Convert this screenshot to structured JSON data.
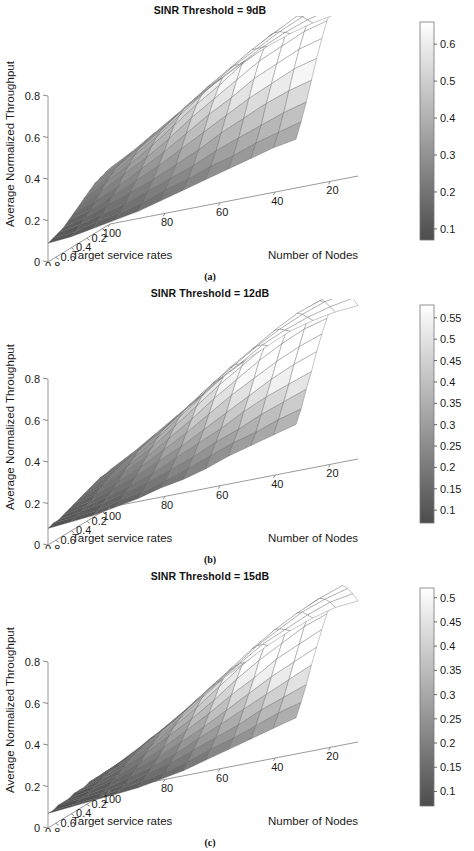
{
  "figure": {
    "panels": [
      {
        "id": "panel-a",
        "title": "SINR Threshold = 9dB",
        "caption": "(a)",
        "zlabel": "Average Normalized Throughput",
        "xlabel": "Target service rates",
        "ylabel": "Number of Nodes",
        "colorbar_ticks": [
          "0.6",
          "0.5",
          "0.4",
          "0.3",
          "0.2",
          "0.1"
        ]
      },
      {
        "id": "panel-b",
        "title": "SINR Threshold = 12dB",
        "caption": "(b)",
        "zlabel": "Average Normalized Throughput",
        "xlabel": "Target service rates",
        "ylabel": "Number of Nodes",
        "colorbar_ticks": [
          "0.55",
          "0.5",
          "0.45",
          "0.4",
          "0.35",
          "0.3",
          "0.25",
          "0.2",
          "0.15",
          "0.1"
        ]
      },
      {
        "id": "panel-c",
        "title": "SINR Threshold = 15dB",
        "caption": "(c)",
        "zlabel": "Average Normalized Throughput",
        "xlabel": "Target service rates",
        "ylabel": "Number of Nodes",
        "colorbar_ticks": [
          "0.5",
          "0.45",
          "0.4",
          "0.35",
          "0.3",
          "0.25",
          "0.2",
          "0.15",
          "0.1"
        ]
      }
    ]
  },
  "chart_data": [
    {
      "type": "surface",
      "panel": "(a)",
      "title": "SINR Threshold = 9dB",
      "xlabel": "Target service rates",
      "ylabel": "Number of Nodes",
      "zlabel": "Average Normalized Throughput",
      "x_ticks": [
        0.8,
        0.6,
        0.4,
        0.2
      ],
      "y_ticks": [
        100,
        80,
        60,
        40,
        20
      ],
      "z_ticks": [
        0,
        0.2,
        0.4,
        0.6,
        0.8
      ],
      "zlim": [
        0,
        0.8
      ],
      "xlim": [
        0.1,
        0.9
      ],
      "ylim": [
        10,
        100
      ],
      "colormap": "gray",
      "clim": [
        0.07,
        0.66
      ],
      "colorbar_ticks": [
        0.1,
        0.2,
        0.3,
        0.4,
        0.5,
        0.6
      ],
      "peak_value": 0.93,
      "left_edge_value": 0.27,
      "front_right_value": 0.13,
      "grid": true,
      "surface_z": [
        [
          0.27,
          0.33,
          0.4,
          0.47,
          0.54,
          0.6,
          0.66,
          0.71,
          0.75,
          0.78,
          0.8,
          0.81
        ],
        [
          0.26,
          0.32,
          0.39,
          0.46,
          0.53,
          0.6,
          0.66,
          0.72,
          0.77,
          0.81,
          0.84,
          0.86
        ],
        [
          0.25,
          0.31,
          0.38,
          0.45,
          0.53,
          0.6,
          0.67,
          0.73,
          0.79,
          0.84,
          0.88,
          0.9
        ],
        [
          0.24,
          0.3,
          0.37,
          0.44,
          0.52,
          0.6,
          0.67,
          0.74,
          0.8,
          0.86,
          0.9,
          0.93
        ],
        [
          0.22,
          0.28,
          0.35,
          0.42,
          0.5,
          0.58,
          0.66,
          0.73,
          0.8,
          0.85,
          0.9,
          0.92
        ],
        [
          0.2,
          0.26,
          0.32,
          0.39,
          0.47,
          0.55,
          0.62,
          0.7,
          0.76,
          0.82,
          0.86,
          0.89
        ],
        [
          0.18,
          0.23,
          0.29,
          0.35,
          0.42,
          0.5,
          0.57,
          0.64,
          0.71,
          0.76,
          0.81,
          0.84
        ],
        [
          0.16,
          0.2,
          0.25,
          0.31,
          0.37,
          0.44,
          0.51,
          0.57,
          0.64,
          0.69,
          0.74,
          0.77
        ],
        [
          0.14,
          0.17,
          0.22,
          0.27,
          0.32,
          0.38,
          0.44,
          0.5,
          0.56,
          0.61,
          0.66,
          0.69
        ],
        [
          0.12,
          0.15,
          0.19,
          0.23,
          0.27,
          0.32,
          0.37,
          0.43,
          0.48,
          0.53,
          0.57,
          0.6
        ],
        [
          0.11,
          0.13,
          0.16,
          0.19,
          0.23,
          0.27,
          0.31,
          0.36,
          0.4,
          0.44,
          0.48,
          0.51
        ],
        [
          0.1,
          0.11,
          0.14,
          0.16,
          0.19,
          0.23,
          0.26,
          0.3,
          0.33,
          0.37,
          0.4,
          0.43
        ],
        [
          0.09,
          0.1,
          0.12,
          0.14,
          0.16,
          0.19,
          0.22,
          0.25,
          0.28,
          0.31,
          0.34,
          0.36
        ]
      ]
    },
    {
      "type": "surface",
      "panel": "(b)",
      "title": "SINR Threshold = 12dB",
      "xlabel": "Target service rates",
      "ylabel": "Number of Nodes",
      "zlabel": "Average Normalized Throughput",
      "x_ticks": [
        0.8,
        0.6,
        0.4,
        0.2
      ],
      "y_ticks": [
        100,
        80,
        60,
        40,
        20
      ],
      "z_ticks": [
        0,
        0.2,
        0.4,
        0.6,
        0.8
      ],
      "zlim": [
        0,
        0.8
      ],
      "xlim": [
        0.1,
        0.9
      ],
      "ylim": [
        10,
        100
      ],
      "colormap": "gray",
      "clim": [
        0.07,
        0.58
      ],
      "colorbar_ticks": [
        0.1,
        0.15,
        0.2,
        0.25,
        0.3,
        0.35,
        0.4,
        0.45,
        0.5,
        0.55
      ],
      "peak_value": 0.86,
      "left_edge_value": 0.18,
      "front_right_value": 0.12,
      "grid": true,
      "surface_z": [
        [
          0.18,
          0.24,
          0.31,
          0.38,
          0.45,
          0.52,
          0.58,
          0.63,
          0.68,
          0.71,
          0.73,
          0.74
        ],
        [
          0.17,
          0.23,
          0.3,
          0.37,
          0.44,
          0.52,
          0.58,
          0.65,
          0.7,
          0.74,
          0.77,
          0.79
        ],
        [
          0.17,
          0.22,
          0.29,
          0.36,
          0.44,
          0.52,
          0.59,
          0.66,
          0.72,
          0.77,
          0.81,
          0.83
        ],
        [
          0.16,
          0.21,
          0.28,
          0.35,
          0.43,
          0.51,
          0.59,
          0.66,
          0.73,
          0.79,
          0.83,
          0.86
        ],
        [
          0.15,
          0.2,
          0.26,
          0.33,
          0.41,
          0.49,
          0.57,
          0.65,
          0.72,
          0.78,
          0.83,
          0.85
        ],
        [
          0.14,
          0.18,
          0.24,
          0.3,
          0.38,
          0.46,
          0.54,
          0.61,
          0.68,
          0.74,
          0.79,
          0.82
        ],
        [
          0.13,
          0.17,
          0.22,
          0.27,
          0.34,
          0.41,
          0.49,
          0.56,
          0.63,
          0.69,
          0.74,
          0.77
        ],
        [
          0.12,
          0.15,
          0.19,
          0.24,
          0.3,
          0.36,
          0.43,
          0.5,
          0.56,
          0.62,
          0.67,
          0.71
        ],
        [
          0.11,
          0.13,
          0.17,
          0.21,
          0.26,
          0.31,
          0.37,
          0.43,
          0.49,
          0.55,
          0.6,
          0.64
        ],
        [
          0.1,
          0.12,
          0.15,
          0.18,
          0.22,
          0.27,
          0.32,
          0.37,
          0.43,
          0.48,
          0.52,
          0.56
        ],
        [
          0.09,
          0.11,
          0.13,
          0.16,
          0.19,
          0.23,
          0.27,
          0.32,
          0.36,
          0.41,
          0.45,
          0.49
        ],
        [
          0.09,
          0.1,
          0.11,
          0.14,
          0.16,
          0.19,
          0.23,
          0.27,
          0.31,
          0.34,
          0.38,
          0.41
        ],
        [
          0.08,
          0.09,
          0.1,
          0.12,
          0.14,
          0.17,
          0.19,
          0.22,
          0.26,
          0.29,
          0.32,
          0.35
        ]
      ]
    },
    {
      "type": "surface",
      "panel": "(c)",
      "title": "SINR Threshold = 15dB",
      "xlabel": "Target service rates",
      "ylabel": "Number of Nodes",
      "zlabel": "Average Normalized Throughput",
      "x_ticks": [
        0.8,
        0.6,
        0.4,
        0.2
      ],
      "y_ticks": [
        100,
        80,
        60,
        40,
        20
      ],
      "z_ticks": [
        0,
        0.2,
        0.4,
        0.6,
        0.8
      ],
      "zlim": [
        0,
        0.8
      ],
      "xlim": [
        0.1,
        0.9
      ],
      "ylim": [
        10,
        100
      ],
      "colormap": "gray",
      "clim": [
        0.07,
        0.52
      ],
      "colorbar_ticks": [
        0.1,
        0.15,
        0.2,
        0.25,
        0.3,
        0.35,
        0.4,
        0.45,
        0.5
      ],
      "peak_value": 0.8,
      "left_edge_value": 0.1,
      "front_right_value": 0.12,
      "grid": true,
      "surface_z": [
        [
          0.1,
          0.16,
          0.22,
          0.29,
          0.36,
          0.43,
          0.49,
          0.55,
          0.6,
          0.64,
          0.67,
          0.68
        ],
        [
          0.1,
          0.15,
          0.22,
          0.28,
          0.36,
          0.43,
          0.5,
          0.57,
          0.62,
          0.67,
          0.71,
          0.73
        ],
        [
          0.1,
          0.15,
          0.21,
          0.28,
          0.35,
          0.43,
          0.5,
          0.58,
          0.64,
          0.7,
          0.74,
          0.77
        ],
        [
          0.1,
          0.14,
          0.2,
          0.27,
          0.34,
          0.42,
          0.5,
          0.58,
          0.65,
          0.71,
          0.76,
          0.8
        ],
        [
          0.1,
          0.14,
          0.19,
          0.25,
          0.32,
          0.4,
          0.48,
          0.56,
          0.64,
          0.7,
          0.76,
          0.79
        ],
        [
          0.09,
          0.13,
          0.18,
          0.23,
          0.3,
          0.37,
          0.45,
          0.53,
          0.6,
          0.67,
          0.72,
          0.76
        ],
        [
          0.09,
          0.12,
          0.16,
          0.21,
          0.27,
          0.33,
          0.4,
          0.48,
          0.55,
          0.61,
          0.67,
          0.71
        ],
        [
          0.09,
          0.11,
          0.14,
          0.18,
          0.23,
          0.29,
          0.35,
          0.42,
          0.48,
          0.55,
          0.6,
          0.65
        ],
        [
          0.08,
          0.1,
          0.13,
          0.16,
          0.2,
          0.25,
          0.3,
          0.36,
          0.42,
          0.48,
          0.53,
          0.58
        ],
        [
          0.08,
          0.09,
          0.11,
          0.14,
          0.17,
          0.21,
          0.26,
          0.31,
          0.36,
          0.41,
          0.46,
          0.51
        ],
        [
          0.08,
          0.09,
          0.1,
          0.12,
          0.15,
          0.18,
          0.22,
          0.26,
          0.3,
          0.35,
          0.39,
          0.43
        ],
        [
          0.07,
          0.08,
          0.09,
          0.11,
          0.13,
          0.15,
          0.18,
          0.22,
          0.25,
          0.29,
          0.33,
          0.36
        ],
        [
          0.07,
          0.08,
          0.09,
          0.1,
          0.11,
          0.13,
          0.15,
          0.18,
          0.21,
          0.24,
          0.27,
          0.3
        ]
      ]
    }
  ]
}
